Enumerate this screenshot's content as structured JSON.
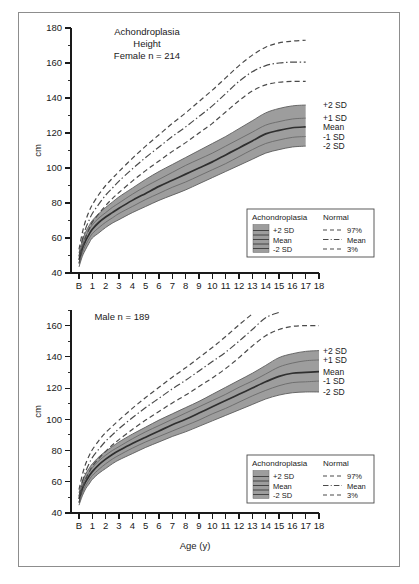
{
  "figure": {
    "units_label": "cm",
    "x_axis_title": "Age (y)",
    "sd_labels": [
      "+2 SD",
      "+1 SD",
      "Mean",
      "-1 SD",
      "-2 SD"
    ],
    "colors": {
      "band_fill": "#9d9d9d",
      "band_edge": "#5c5c5c",
      "mean_line": "#2f2f2f",
      "normal_line": "#4a4a4a",
      "frame": "#8d8d8d",
      "axis": "#1a1a1a"
    }
  },
  "legend": {
    "heading_left": "Achondroplasia",
    "heading_right": "Normal",
    "left_items": [
      "+2 SD",
      "Mean",
      "-2 SD"
    ],
    "right_items": [
      "97%",
      "Mean",
      "3%"
    ]
  },
  "chart_data": [
    {
      "type": "line",
      "id": "female",
      "title_lines": [
        "Achondroplasia",
        "Height",
        "Female n = 214"
      ],
      "title": "Achondroplasia Height Female n = 214",
      "xlabel": "",
      "ylabel": "cm",
      "xlim": [
        -0.6,
        18
      ],
      "ylim": [
        40,
        180
      ],
      "ytick_step": 20,
      "yminor_step": 10,
      "grid": false,
      "legend_position": "bottom-right",
      "xtick_labels": [
        "B",
        "1",
        "2",
        "3",
        "4",
        "5",
        "6",
        "7",
        "8",
        "9",
        "10",
        "11",
        "12",
        "13",
        "14",
        "15",
        "16",
        "17",
        "18"
      ],
      "x": [
        0,
        0.25,
        0.5,
        0.75,
        1,
        1.5,
        2,
        2.5,
        3,
        4,
        5,
        6,
        7,
        8,
        9,
        10,
        11,
        12,
        13,
        14,
        15,
        16,
        17
      ],
      "series": [
        {
          "name": "Achondroplasia +2 SD",
          "values": [
            51.5,
            58.5,
            63.5,
            67.0,
            70.0,
            74.0,
            77.5,
            80.5,
            83.5,
            88.5,
            93.5,
            98.0,
            102.0,
            106.0,
            110.0,
            114.0,
            118.0,
            122.5,
            127.0,
            131.5,
            134.0,
            135.5,
            136.0
          ]
        },
        {
          "name": "Achondroplasia +1 SD",
          "values": [
            49.5,
            56.0,
            61.0,
            64.5,
            67.5,
            71.5,
            74.5,
            77.5,
            80.0,
            85.0,
            89.5,
            93.5,
            97.5,
            101.5,
            105.0,
            108.5,
            112.5,
            116.5,
            120.5,
            124.5,
            126.5,
            128.0,
            128.5
          ]
        },
        {
          "name": "Achondroplasia Mean",
          "values": [
            47.5,
            54.0,
            58.5,
            62.0,
            65.0,
            69.0,
            72.0,
            74.5,
            77.0,
            81.5,
            85.5,
            89.5,
            93.0,
            96.5,
            100.0,
            103.5,
            107.5,
            111.5,
            115.5,
            119.5,
            121.5,
            123.0,
            123.5
          ]
        },
        {
          "name": "Achondroplasia -1 SD",
          "values": [
            45.5,
            51.5,
            56.0,
            59.5,
            62.5,
            66.0,
            69.0,
            71.5,
            74.0,
            78.0,
            82.0,
            85.5,
            89.0,
            92.0,
            95.5,
            99.0,
            102.5,
            106.5,
            110.5,
            114.0,
            116.0,
            117.5,
            118.0
          ]
        },
        {
          "name": "Achondroplasia -2 SD",
          "values": [
            43.5,
            49.5,
            53.5,
            57.0,
            60.0,
            63.0,
            66.0,
            68.5,
            70.5,
            74.5,
            78.0,
            81.5,
            84.5,
            87.5,
            91.0,
            94.5,
            98.0,
            101.5,
            105.0,
            108.5,
            110.5,
            112.0,
            112.5
          ]
        },
        {
          "name": "Normal 97%",
          "values": [
            53.5,
            63.0,
            70.0,
            75.0,
            79.0,
            85.0,
            90.0,
            94.0,
            98.0,
            105.5,
            112.5,
            119.0,
            125.5,
            131.5,
            138.0,
            144.5,
            151.5,
            158.5,
            164.5,
            169.0,
            171.5,
            172.5,
            173.0
          ]
        },
        {
          "name": "Normal Mean",
          "values": [
            49.5,
            59.0,
            65.5,
            70.0,
            74.0,
            79.5,
            84.5,
            88.5,
            92.5,
            99.5,
            106.0,
            112.0,
            118.0,
            123.5,
            129.5,
            135.5,
            142.5,
            149.5,
            155.0,
            158.5,
            160.0,
            160.5,
            160.5
          ]
        },
        {
          "name": "Normal 3%",
          "values": [
            45.5,
            54.0,
            60.5,
            65.0,
            69.0,
            74.0,
            78.5,
            82.5,
            86.0,
            92.5,
            98.5,
            104.0,
            109.5,
            114.5,
            120.0,
            125.5,
            132.0,
            138.5,
            144.0,
            147.5,
            149.0,
            149.5,
            149.5
          ]
        }
      ]
    },
    {
      "type": "line",
      "id": "male",
      "title_lines": [
        "Male n = 189"
      ],
      "title": "Male n = 189",
      "xlabel": "Age (y)",
      "ylabel": "cm",
      "xlim": [
        -0.6,
        18
      ],
      "ylim": [
        40,
        170
      ],
      "ytick_step": 20,
      "yminor_step": 10,
      "grid": false,
      "legend_position": "bottom-right",
      "xtick_labels": [
        "B",
        "1",
        "2",
        "3",
        "4",
        "5",
        "6",
        "7",
        "8",
        "9",
        "10",
        "11",
        "12",
        "13",
        "14",
        "15",
        "16",
        "17",
        "18"
      ],
      "x": [
        0,
        0.25,
        0.5,
        0.75,
        1,
        1.5,
        2,
        2.5,
        3,
        4,
        5,
        6,
        7,
        8,
        9,
        10,
        11,
        12,
        13,
        14,
        15,
        16,
        17,
        18
      ],
      "series": [
        {
          "name": "Achondroplasia +2 SD",
          "values": [
            53.0,
            60.0,
            65.0,
            68.5,
            71.5,
            76.0,
            79.5,
            82.5,
            85.5,
            90.5,
            95.0,
            99.5,
            103.5,
            107.5,
            111.5,
            116.0,
            120.5,
            125.0,
            129.5,
            134.5,
            139.5,
            142.0,
            143.5,
            144.0
          ]
        },
        {
          "name": "Achondroplasia +1 SD",
          "values": [
            51.0,
            57.5,
            62.5,
            66.0,
            69.0,
            73.5,
            77.0,
            80.0,
            82.5,
            87.5,
            92.0,
            96.0,
            100.0,
            104.0,
            108.0,
            112.0,
            116.0,
            120.5,
            124.5,
            129.0,
            133.5,
            136.0,
            137.5,
            138.0
          ]
        },
        {
          "name": "Achondroplasia Mean",
          "values": [
            49.0,
            55.5,
            60.0,
            63.5,
            66.5,
            71.0,
            74.5,
            77.5,
            80.0,
            84.5,
            88.5,
            92.5,
            96.5,
            100.0,
            104.0,
            108.0,
            112.0,
            116.0,
            120.0,
            124.0,
            127.5,
            129.5,
            130.0,
            130.5
          ]
        },
        {
          "name": "Achondroplasia -1 SD",
          "values": [
            47.0,
            53.0,
            57.5,
            61.0,
            64.0,
            68.0,
            71.5,
            74.5,
            77.0,
            81.5,
            85.5,
            89.0,
            92.5,
            96.0,
            99.5,
            103.5,
            107.0,
            111.0,
            115.0,
            118.5,
            121.5,
            123.5,
            124.0,
            124.5
          ]
        },
        {
          "name": "Achondroplasia -2 SD",
          "values": [
            45.0,
            51.0,
            55.5,
            58.5,
            61.5,
            65.5,
            68.5,
            71.5,
            74.0,
            78.0,
            82.0,
            85.5,
            89.0,
            92.0,
            95.5,
            99.0,
            102.5,
            106.0,
            109.5,
            113.0,
            115.5,
            117.0,
            117.5,
            117.5
          ]
        },
        {
          "name": "Normal 97%",
          "values": [
            55.0,
            64.5,
            71.5,
            76.5,
            80.5,
            86.5,
            91.5,
            95.5,
            99.5,
            107.0,
            114.0,
            120.5,
            127.0,
            133.0,
            139.5,
            146.0,
            153.0,
            160.5,
            167.5,
            null,
            null,
            null,
            null,
            null
          ]
        },
        {
          "name": "Normal Mean",
          "values": [
            50.5,
            60.0,
            66.5,
            71.5,
            75.5,
            81.0,
            86.0,
            90.0,
            94.0,
            101.0,
            107.5,
            113.5,
            119.5,
            125.0,
            131.0,
            137.0,
            143.0,
            150.0,
            157.5,
            165.0,
            168.5,
            null,
            null,
            null
          ]
        },
        {
          "name": "Normal 3%",
          "values": [
            46.5,
            55.5,
            61.5,
            66.0,
            70.0,
            75.0,
            79.5,
            83.5,
            87.0,
            93.5,
            99.5,
            105.0,
            110.5,
            115.5,
            121.0,
            126.5,
            132.5,
            139.5,
            147.0,
            153.5,
            157.5,
            159.5,
            160.0,
            160.0
          ]
        }
      ]
    }
  ]
}
